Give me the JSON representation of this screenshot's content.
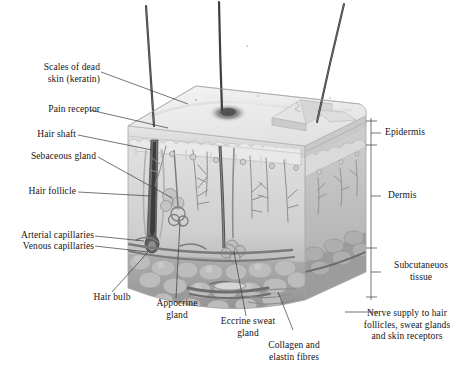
{
  "figure": {
    "type": "anatomical-cross-section-diagram",
    "palette": {
      "background": "#ffffff",
      "text": "#141414",
      "leader_line": "#3a3a3a",
      "epidermis_top": "#ededed",
      "epidermis_face": "#d8d8d8",
      "dermis": "#dcdcdc",
      "dermis_shadow": "#c2c2c2",
      "subcutaneous": "#a6a6a6",
      "fat_lobule": "#b8b8b8",
      "hair_dark": "#4a4a4a",
      "vessel": "#8a8a8a"
    }
  },
  "labels_left": [
    {
      "id": "scales-of-dead-skin",
      "text": "Scales of dead\nskin (keratin)"
    },
    {
      "id": "pain-receptor",
      "text": "Pain receptor"
    },
    {
      "id": "hair-shaft",
      "text": "Hair shaft"
    },
    {
      "id": "sebaceous-gland",
      "text": "Sebaceous gland"
    },
    {
      "id": "hair-follicle",
      "text": "Hair follicle"
    },
    {
      "id": "arterial-capillaries",
      "text": "Arterial capillaries"
    },
    {
      "id": "venous-capillaries",
      "text": "Venous capillaries"
    }
  ],
  "labels_bottom": [
    {
      "id": "hair-bulb",
      "text": "Hair bulb"
    },
    {
      "id": "appocrine-gland",
      "text": "Appocrine\ngland"
    },
    {
      "id": "eccrine-sweat-gland",
      "text": "Eccrine sweat\ngland"
    },
    {
      "id": "collagen-and-elastin-fibres",
      "text": "Collagen and\nelastin fibres"
    }
  ],
  "labels_right": [
    {
      "id": "epidermis",
      "text": "Epidermis"
    },
    {
      "id": "dermis",
      "text": "Dermis"
    },
    {
      "id": "subcutaneous-tissue",
      "text": "Subcutaneuos\ntissue"
    },
    {
      "id": "nerve-supply",
      "text": "Nerve supply to hair\nfollicles, sweat glands\nand skin receptors"
    }
  ]
}
